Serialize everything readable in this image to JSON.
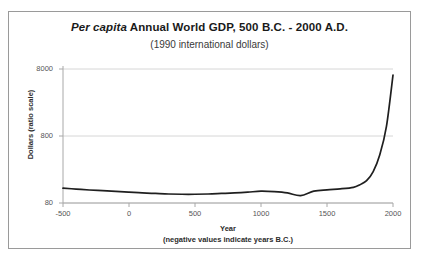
{
  "chart_data": {
    "type": "line",
    "title_italic_prefix": "Per capita",
    "title_rest": " Annual World GDP, 500 B.C. - 2000 A.D.",
    "title": "Per capita Annual World GDP, 500 B.C. - 2000 A.D.",
    "subtitle": "(1990 international dollars)",
    "xlabel": "Year",
    "xlabel_note": "(negative values indicate years B.C.)",
    "ylabel": "Dollars (ratio scale)",
    "yscale": "log",
    "ylim": [
      80,
      8000
    ],
    "xlim": [
      -500,
      2000
    ],
    "grid": true,
    "legend": "none",
    "yticks": [
      80,
      800,
      8000
    ],
    "ytick_labels": [
      "80",
      "800",
      "8000"
    ],
    "xticks": [
      -500,
      0,
      500,
      1000,
      1500,
      2000
    ],
    "xtick_labels": [
      "-500",
      "0",
      "500",
      "1000",
      "1500",
      "2000"
    ],
    "series": [
      {
        "name": "Per capita Annual World GDP",
        "color": "#1f1f1f",
        "x": [
          -500,
          -400,
          -300,
          -200,
          -100,
          0,
          100,
          200,
          300,
          400,
          500,
          600,
          700,
          800,
          900,
          1000,
          1100,
          1200,
          1300,
          1400,
          1500,
          1600,
          1700,
          1750,
          1800,
          1850,
          1900,
          1950,
          2000
        ],
        "y": [
          133,
          129,
          125,
          122,
          119,
          116,
          113,
          111,
          109,
          108,
          108,
          109,
          111,
          113,
          116,
          120,
          118,
          113,
          103,
          120,
          126,
          130,
          137,
          150,
          172,
          235,
          420,
          1100,
          6500
        ]
      }
    ]
  },
  "figure": {
    "border_color": "#9a9a9a",
    "grid_color": "#d6d6d6",
    "axis_color": "#a8a8a8",
    "line_color": "#1f1f1f",
    "background": "#ffffff"
  }
}
